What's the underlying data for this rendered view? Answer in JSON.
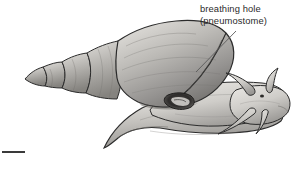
{
  "figure": {
    "background_color": "#ffffff",
    "width": 298,
    "height": 169,
    "style": "grayscale pen-and-ink stipple drawing"
  },
  "annotation": {
    "label_line_1": "breathing hole",
    "label_line_2": "(pneumostome)",
    "text_color": "#2a2a2a",
    "leader_line": {
      "from_x": 236,
      "from_y": 31,
      "to_x": 196,
      "to_y": 72
    }
  },
  "scale": {
    "label": "ter",
    "note_cropped": "left edge of word cut off by image border",
    "bar_color": "#3a3a3a"
  },
  "subject": {
    "name": "snail",
    "parts": [
      {
        "name": "shell-spire",
        "description": "pointed coiled apex at left with four whorls"
      },
      {
        "name": "shell-body-whorl",
        "description": "large rounded final whorl"
      },
      {
        "name": "pneumostome",
        "description": "dark oval breathing opening at shell aperture edge"
      },
      {
        "name": "mantle-collar",
        "description": "tissue rim around aperture"
      },
      {
        "name": "foot",
        "description": "broad muscular sole extending forward and down"
      },
      {
        "name": "head",
        "description": "front of body bearing tentacles"
      },
      {
        "name": "upper-tentacle-pair",
        "description": "long optic tentacles with eye spots"
      },
      {
        "name": "lower-tentacle-pair",
        "description": "short sensory tentacles"
      },
      {
        "name": "eye-spot",
        "description": "dark dot at tentacle base region"
      }
    ]
  },
  "palette": {
    "outline": "#2b2b2b",
    "shell_light": "#d8d6d2",
    "shell_mid": "#a9a7a3",
    "shell_dark": "#6e6c69",
    "body_light": "#dedcd8",
    "body_mid": "#b3b1ad",
    "body_dark": "#7d7b78",
    "pneumostome_dark": "#2e2c2b"
  }
}
